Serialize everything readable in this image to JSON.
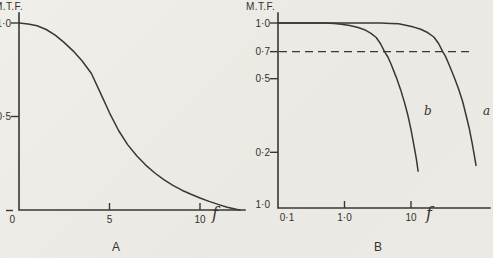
{
  "figure": {
    "background": "#edebe6",
    "ink": "#3a3731",
    "description_visible_text_only": true
  },
  "chart_data": [
    {
      "id": "A",
      "type": "line",
      "panel_label": "A",
      "ylabel": "M.T.F.",
      "xlabel": "f",
      "x_scale": "linear",
      "y_scale": "linear",
      "xlim": [
        0,
        12.5
      ],
      "ylim": [
        0,
        1.08
      ],
      "grid": false,
      "x_ticks": [
        {
          "value": 5,
          "label": "5"
        },
        {
          "value": 10,
          "label": "10"
        }
      ],
      "y_ticks": [
        {
          "value": 1.0,
          "label": "1·0"
        },
        {
          "value": 0.5,
          "label": "0·5"
        },
        {
          "value": 0,
          "label": "0",
          "label_pos": "below"
        }
      ],
      "series": [
        {
          "name": "mtf",
          "label": "",
          "points": [
            [
              0,
              1.0
            ],
            [
              0.5,
              0.995
            ],
            [
              1,
              0.985
            ],
            [
              1.5,
              0.965
            ],
            [
              2,
              0.935
            ],
            [
              2.5,
              0.895
            ],
            [
              3,
              0.85
            ],
            [
              3.5,
              0.795
            ],
            [
              4,
              0.73
            ],
            [
              4.5,
              0.625
            ],
            [
              5,
              0.52
            ],
            [
              5.5,
              0.425
            ],
            [
              6,
              0.35
            ],
            [
              6.5,
              0.29
            ],
            [
              7,
              0.24
            ],
            [
              7.5,
              0.198
            ],
            [
              8,
              0.162
            ],
            [
              8.5,
              0.132
            ],
            [
              9,
              0.106
            ],
            [
              9.5,
              0.084
            ],
            [
              10,
              0.064
            ],
            [
              10.5,
              0.046
            ],
            [
              11,
              0.03
            ],
            [
              11.5,
              0.015
            ],
            [
              12,
              0.004
            ],
            [
              12.2,
              0
            ]
          ]
        }
      ]
    },
    {
      "id": "B",
      "type": "line",
      "panel_label": "B",
      "ylabel": "M.T.F.",
      "xlabel": "f",
      "x_scale": "log",
      "y_scale": "log",
      "xlim": [
        0.1,
        150
      ],
      "ylim": [
        0.1,
        1.0
      ],
      "grid": false,
      "x_ticks": [
        {
          "value": 0.1,
          "label": "0·1",
          "tick": false,
          "label_dx": 9
        },
        {
          "value": 1.0,
          "label": "1·0"
        },
        {
          "value": 10,
          "label": "10"
        }
      ],
      "y_ticks": [
        {
          "value": 1.0,
          "label": "1·0"
        },
        {
          "value": 0.7,
          "label": "0·7"
        },
        {
          "value": 0.5,
          "label": "0·5"
        },
        {
          "value": 0.2,
          "label": "0·2"
        },
        {
          "value": 0.1,
          "label": "1·0",
          "tick": false
        }
      ],
      "reference_line": {
        "y": 0.7,
        "x_range": [
          0.1,
          85
        ],
        "style": "dashed"
      },
      "series": [
        {
          "name": "b",
          "label": "b",
          "points": [
            [
              0.1,
              1.0
            ],
            [
              0.3,
              1.0
            ],
            [
              0.5,
              1.0
            ],
            [
              0.7,
              0.995
            ],
            [
              0.9,
              0.985
            ],
            [
              1.2,
              0.97
            ],
            [
              1.6,
              0.945
            ],
            [
              2,
              0.92
            ],
            [
              2.5,
              0.88
            ],
            [
              3,
              0.835
            ],
            [
              3.5,
              0.77
            ],
            [
              4,
              0.7
            ],
            [
              4.5,
              0.655
            ],
            [
              5,
              0.6
            ],
            [
              6,
              0.51
            ],
            [
              7,
              0.435
            ],
            [
              8,
              0.37
            ],
            [
              9,
              0.315
            ],
            [
              10,
              0.265
            ],
            [
              11,
              0.22
            ],
            [
              12,
              0.185
            ],
            [
              12.8,
              0.158
            ]
          ]
        },
        {
          "name": "a",
          "label": "a",
          "points": [
            [
              0.1,
              1.0
            ],
            [
              2,
              1.0
            ],
            [
              3.5,
              1.0
            ],
            [
              5,
              0.995
            ],
            [
              6.5,
              0.99
            ],
            [
              8,
              0.975
            ],
            [
              11,
              0.95
            ],
            [
              14,
              0.925
            ],
            [
              18,
              0.885
            ],
            [
              22,
              0.84
            ],
            [
              26,
              0.775
            ],
            [
              30,
              0.7
            ],
            [
              33,
              0.66
            ],
            [
              37,
              0.6
            ],
            [
              44,
              0.515
            ],
            [
              52,
              0.44
            ],
            [
              60,
              0.375
            ],
            [
              67,
              0.32
            ],
            [
              75,
              0.27
            ],
            [
              83,
              0.225
            ],
            [
              90,
              0.19
            ],
            [
              95,
              0.17
            ]
          ]
        }
      ]
    }
  ]
}
